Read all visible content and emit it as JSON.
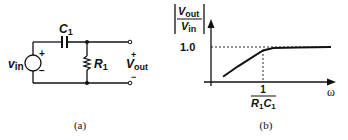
{
  "figure_a": {
    "caption": "(a)",
    "source_label": "v",
    "source_sub": "in",
    "source_plus": "+",
    "source_minus": "−",
    "capacitor_label": "C",
    "capacitor_sub": "1",
    "resistor_label": "R",
    "resistor_sub": "1",
    "output_label": "V",
    "output_sub": "out",
    "output_plus": "+",
    "output_minus": "−"
  },
  "figure_b": {
    "caption": "(b)",
    "y_label_num": "V",
    "y_label_num_sub": "out",
    "y_label_den": "V",
    "y_label_den_sub": "in",
    "y_tick": "1.0",
    "x_tick_num": "1",
    "x_tick_den_r": "R",
    "x_tick_den_r_sub": "1",
    "x_tick_den_c": "C",
    "x_tick_den_c_sub": "1",
    "x_label": "ω"
  },
  "chart_data": {
    "type": "line",
    "title": "",
    "xlabel": "ω",
    "ylabel": "|Vout/Vin|",
    "x_ticks": [
      "1/(R1C1)"
    ],
    "y_ticks": [
      "1.0"
    ],
    "series": [
      {
        "name": "|Vout/Vin|",
        "x_rel": [
          0.2,
          0.5,
          1.0,
          1.3,
          2.0,
          3.0
        ],
        "values": [
          0.15,
          0.45,
          0.9,
          0.97,
          0.99,
          1.0
        ]
      }
    ],
    "ylim": [
      0,
      1.3
    ],
    "grid": false,
    "reference_lines": [
      "y=1.0 dashed",
      "x=1/(R1C1) dashed"
    ]
  }
}
